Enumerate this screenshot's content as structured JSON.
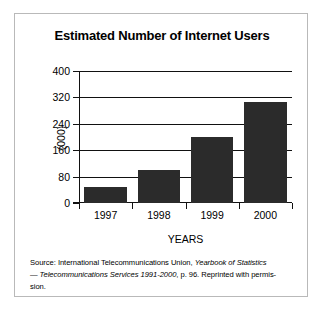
{
  "figure": {
    "title": "Estimated Number of Internet Users",
    "ylabel": "(000)",
    "xlabel": "YEARS",
    "source_line_1_prefix": "Source: International Telecommunications Union, ",
    "source_line_1_italic": "Yearbook of Statistics",
    "source_line_2_dash": "— ",
    "source_line_2_italic": "Telecommunications Services 1991-2000",
    "source_line_2_rest": ", p. 96. Reprinted with permis-",
    "source_line_3": "sion.",
    "bar_color": "#2b2b2b",
    "axis_color": "#111111",
    "frame_color": "#b9b9b9"
  },
  "chart_data": {
    "type": "bar",
    "title": "Estimated Number of Internet Users",
    "xlabel": "YEARS",
    "ylabel": "(000)",
    "categories": [
      "1997",
      "1998",
      "1999",
      "2000"
    ],
    "values": [
      50,
      100,
      200,
      305
    ],
    "ylim": [
      0,
      400
    ],
    "yticks": [
      0,
      80,
      160,
      240,
      320,
      400
    ],
    "ytick_labels": [
      "0",
      "80",
      "160",
      "240",
      "320",
      "400"
    ],
    "grid": true,
    "legend": null
  }
}
